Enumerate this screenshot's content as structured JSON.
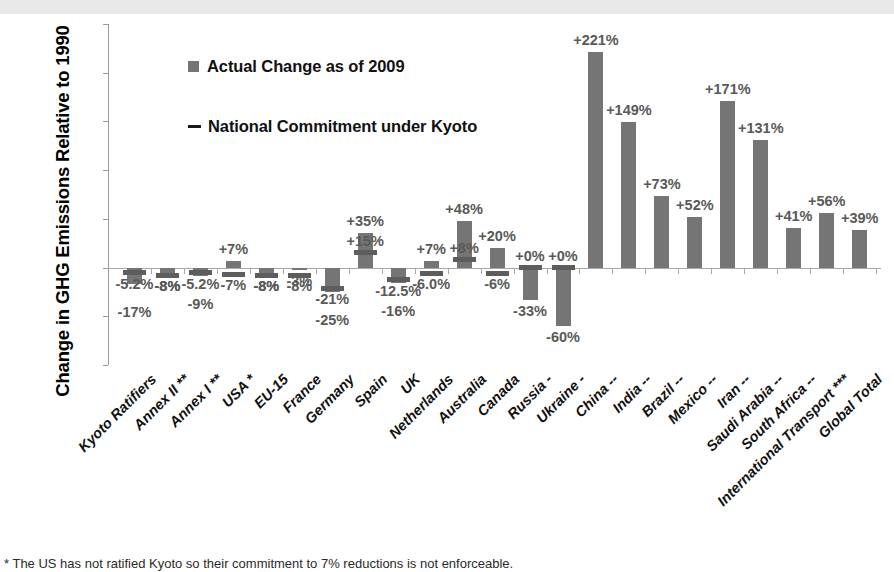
{
  "chart_data": {
    "type": "bar",
    "title": "",
    "xlabel": "",
    "ylabel": "Change in GHG Emissions Relative to 1990",
    "ylim": [
      -100,
      250
    ],
    "ytick_labels": [
      "250%",
      "200%",
      "150%",
      "100%",
      "50%",
      "0%",
      "-50%",
      "-100%"
    ],
    "ytick_values": [
      250,
      200,
      150,
      100,
      50,
      0,
      -50,
      -100
    ],
    "grid": false,
    "legend_position": "upper-left",
    "legend": [
      {
        "key": "actual",
        "label": "Actual Change as of 2009",
        "marker": "square",
        "color": "#757575"
      },
      {
        "key": "commitment",
        "label": "National Commitment under Kyoto",
        "marker": "dash",
        "color": "#1a1a1a"
      }
    ],
    "categories": [
      "Kyoto Ratifiers",
      "Annex II **",
      "Annex I **",
      "USA *",
      "EU-15",
      "France",
      "Germany",
      "Spain",
      "UK",
      "Netherlands",
      "Australia",
      "Canada",
      "Russia -",
      "Ukraine -",
      "China --",
      "India --",
      "Brazil --",
      "Mexico --",
      "Iran --",
      "Saudi Arabia --",
      "South Africa --",
      "International Transport ***",
      "Global Total"
    ],
    "series": [
      {
        "name": "Actual Change as of 2009",
        "values": [
          -17,
          -8,
          -9,
          7,
          -8,
          -3,
          -25,
          35,
          -16,
          7,
          48,
          20,
          -33,
          -60,
          221,
          149,
          73,
          52,
          171,
          131,
          41,
          56,
          39
        ],
        "labels": [
          "-17%",
          "-8%",
          "-9%",
          "+7%",
          "-8%",
          "-3%",
          "-25%",
          "+35%",
          "-16%",
          "+7%",
          "+48%",
          "+20%",
          "-33%",
          "-60%",
          "+221%",
          "+149%",
          "+73%",
          "+52%",
          "+171%",
          "+131%",
          "+41%",
          "+56%",
          "+39%"
        ]
      },
      {
        "name": "National Commitment under Kyoto",
        "values": [
          -5.2,
          -8,
          -5.2,
          -7,
          -8,
          -8,
          -21,
          15,
          -12.5,
          -6.0,
          8,
          -6,
          0,
          0,
          null,
          null,
          null,
          null,
          null,
          null,
          null,
          null,
          null
        ],
        "labels": [
          "-5.2%",
          "-8%",
          "-5.2%",
          "-7%",
          "-8%",
          "-8%",
          "-21%",
          "+15%",
          "-12.5%",
          "-6.0%",
          "+8%",
          "-6%",
          "+0%",
          "+0%",
          "",
          "",
          "",
          "",
          "",
          "",
          "",
          "",
          ""
        ]
      }
    ]
  },
  "footnote": "* The US has not ratified Kyoto so their commitment to 7% reductions is not enforceable.",
  "colors": {
    "bar": "#757575",
    "commitment": "#5d5d5d",
    "label_text": "#595959",
    "axis": "#9a9a9a",
    "top_band": "#e9e9e9"
  }
}
